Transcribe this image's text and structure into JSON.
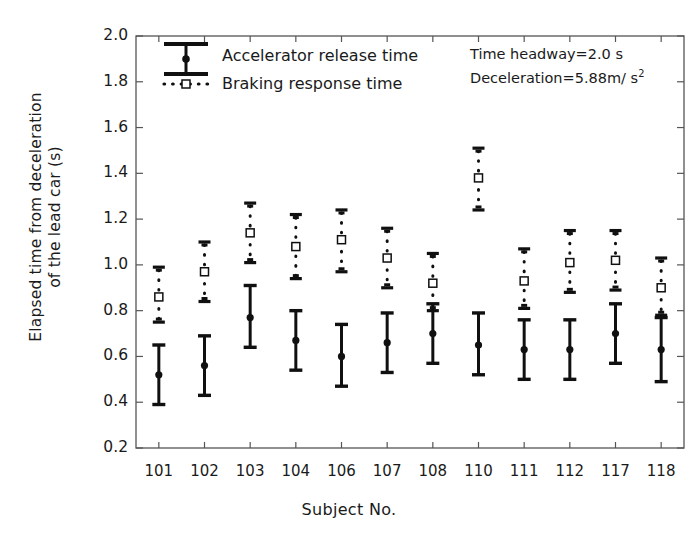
{
  "chart_data": {
    "type": "scatter",
    "title": "",
    "xlabel": "Subject No.",
    "ylabel": "Elapsed time from deceleration\nof the lead car (s)",
    "ylim": [
      0.2,
      2.0
    ],
    "ytick_step": 0.2,
    "yticks": [
      "2.0",
      "1.8",
      "1.6",
      "1.4",
      "1.2",
      "1.0",
      "0.8",
      "0.6",
      "0.4",
      "0.2"
    ],
    "grid": false,
    "legend_position": "top-left",
    "categories": [
      "101",
      "102",
      "103",
      "104",
      "106",
      "107",
      "108",
      "110",
      "111",
      "112",
      "117",
      "118"
    ],
    "series": [
      {
        "name": "Accelerator release time",
        "marker": "filled-circle",
        "line": "solid",
        "color": "#101010",
        "values": [
          0.52,
          0.56,
          0.77,
          0.67,
          0.6,
          0.66,
          0.7,
          0.65,
          0.63,
          0.63,
          0.7,
          0.63
        ],
        "upper": [
          0.65,
          0.69,
          0.91,
          0.8,
          0.74,
          0.79,
          0.83,
          0.79,
          0.76,
          0.76,
          0.83,
          0.77
        ],
        "lower": [
          0.39,
          0.43,
          0.64,
          0.54,
          0.47,
          0.53,
          0.57,
          0.52,
          0.5,
          0.5,
          0.57,
          0.49
        ]
      },
      {
        "name": "Braking response time",
        "marker": "open-square",
        "line": "dotted",
        "color": "#101010",
        "values": [
          0.86,
          0.97,
          1.14,
          1.08,
          1.11,
          1.03,
          0.92,
          1.38,
          0.93,
          1.01,
          1.02,
          0.9
        ],
        "upper": [
          0.99,
          1.1,
          1.27,
          1.22,
          1.24,
          1.16,
          1.05,
          1.51,
          1.07,
          1.15,
          1.15,
          1.03
        ],
        "lower": [
          0.75,
          0.84,
          1.01,
          0.94,
          0.97,
          0.9,
          0.8,
          1.24,
          0.81,
          0.88,
          0.89,
          0.78
        ]
      }
    ],
    "annotations": [
      {
        "text": "Time headway=2.0 s"
      },
      {
        "text": "Deceleration=5.88m/ s",
        "sup": "2"
      }
    ]
  },
  "legend": {
    "items": [
      {
        "label": "Accelerator release time",
        "marker": "errorbar-solid-circle"
      },
      {
        "label": "Braking response time",
        "marker": "errorbar-dotted-square"
      }
    ]
  }
}
